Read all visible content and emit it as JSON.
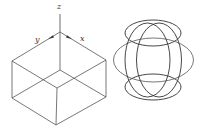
{
  "diagram": {
    "left_figure": {
      "type": "isometric-box-with-axes",
      "axis_labels": {
        "z": "z",
        "y": "y",
        "x": "x"
      },
      "stroke_color": "#444444"
    },
    "right_figure": {
      "type": "overlapping-ellipses",
      "stroke_color": "#333333"
    }
  }
}
